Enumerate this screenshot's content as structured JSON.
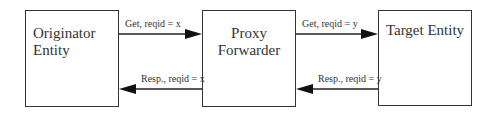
{
  "entities": [
    {
      "id": "originator",
      "label_lines": [
        "Originator",
        "Entity"
      ]
    },
    {
      "id": "proxy",
      "label_lines": [
        "Proxy",
        "Forwarder"
      ]
    },
    {
      "id": "target",
      "label_lines": [
        "Target Entity"
      ]
    }
  ],
  "messages": [
    {
      "from": "originator",
      "to": "proxy",
      "label": "Get, reqid = x"
    },
    {
      "from": "proxy",
      "to": "target",
      "label": "Get, reqid = y"
    },
    {
      "from": "proxy",
      "to": "originator",
      "label": "Resp., reqid = x"
    },
    {
      "from": "target",
      "to": "proxy",
      "label": "Resp., reqid = y"
    }
  ]
}
